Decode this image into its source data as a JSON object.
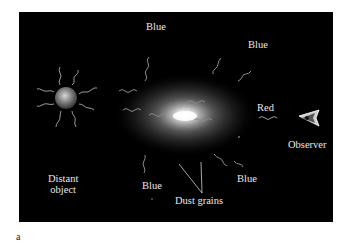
{
  "figure": {
    "panel_label": "a",
    "background_color": "#000000",
    "wave_color": "#9a9a9a",
    "labels": {
      "blue_top_left": "Blue",
      "blue_top_right": "Blue",
      "blue_bottom_left": "Blue",
      "blue_bottom_right": "Blue",
      "red": "Red",
      "observer": "Observer",
      "distant_object_line1": "Distant",
      "distant_object_line2": "object",
      "dust_grains": "Dust grains"
    },
    "elements": [
      {
        "name": "distant-object",
        "type": "glowing sphere with radiating wavy light rays"
      },
      {
        "name": "dust-cloud",
        "type": "diffuse glowing elliptical cloud scattering light"
      },
      {
        "name": "observer-eye",
        "type": "eye icon facing the cloud"
      }
    ]
  }
}
